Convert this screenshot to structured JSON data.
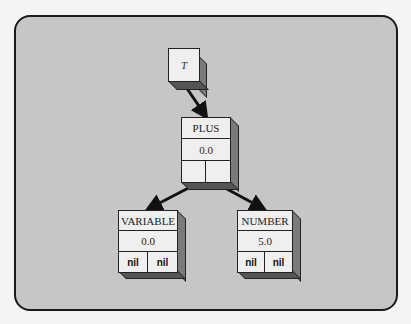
{
  "diagram": {
    "root": {
      "label": "T"
    },
    "nodes": [
      {
        "id": "plus",
        "type": "PLUS",
        "value": "0.0",
        "left": "",
        "right": ""
      },
      {
        "id": "variable",
        "type": "VARIABLE",
        "value": "0.0",
        "left": "nil",
        "right": "nil"
      },
      {
        "id": "number",
        "type": "NUMBER",
        "value": "5.0",
        "left": "nil",
        "right": "nil"
      }
    ],
    "edges": [
      {
        "from": "T",
        "to": "PLUS"
      },
      {
        "from": "PLUS.left",
        "to": "VARIABLE"
      },
      {
        "from": "PLUS.right",
        "to": "NUMBER"
      }
    ]
  }
}
